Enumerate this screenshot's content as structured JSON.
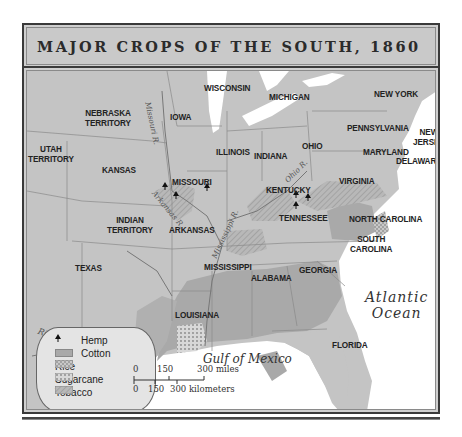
{
  "title": "MAJOR CROPS OF THE SOUTH, 1860",
  "colors": {
    "frame": "#3a3a3a",
    "title_bg": "#c9c9c9",
    "land": "#c4c4c4",
    "cotton": "#a9a9a9",
    "water": "#ffffff",
    "legend_bg": "#e4e4e4"
  },
  "states": {
    "wisconsin": "WISCONSIN",
    "michigan": "MICHIGAN",
    "new_york": "NEW YORK",
    "nebraska": [
      "NEBRASKA",
      "TERRITORY"
    ],
    "iowa": "IOWA",
    "utah": [
      "UTAH",
      "TERRITORY"
    ],
    "kansas": "KANSAS",
    "illinois": "ILLINOIS",
    "indiana": "INDIANA",
    "ohio": "OHIO",
    "pennsylvania": "PENNSYLVANIA",
    "new_jersey": [
      "NEW",
      "JERSEY"
    ],
    "maryland": "MARYLAND",
    "delaware": "DELAWARE",
    "missouri": "MISSOURI",
    "kentucky": "KENTUCKY",
    "virginia": "VIRGINIA",
    "indian_territory": [
      "INDIAN",
      "TERRITORY"
    ],
    "arkansas": "ARKANSAS",
    "tennessee": "TENNESSEE",
    "north_carolina": "NORTH CAROLINA",
    "south_carolina": [
      "SOUTH",
      "CAROLINA"
    ],
    "texas": "TEXAS",
    "mississippi": "MISSISSIPPI",
    "alabama": "ALABAMA",
    "georgia": "GEORGIA",
    "louisiana": "LOUISIANA",
    "florida": "FLORIDA"
  },
  "water_bodies": {
    "atlantic": [
      "Atlantic",
      "Ocean"
    ],
    "gulf": "Gulf of Mexico"
  },
  "rivers": {
    "missouri": "Missouri R.",
    "arkansas": "Arkansas R.",
    "mississippi": "Mississippi R.",
    "ohio": "Ohio R.",
    "rio_grande": "Rio Grande"
  },
  "legend": {
    "items": [
      {
        "label": "Hemp",
        "icon": "hemp-leaf-icon"
      },
      {
        "label": "Cotton",
        "pattern": "solid-gray"
      },
      {
        "label": "Rice",
        "pattern": "crosshatch"
      },
      {
        "label": "Sugarcane",
        "pattern": "dotted"
      },
      {
        "label": "Tobacco",
        "pattern": "diagonal-lines"
      }
    ]
  },
  "scale": {
    "miles": [
      "0",
      "150",
      "300 miles"
    ],
    "kilometers": [
      "0",
      "150",
      "300 kilometers"
    ]
  }
}
